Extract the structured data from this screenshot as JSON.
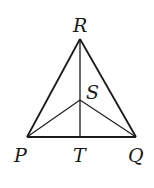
{
  "diagram": {
    "type": "triangle",
    "points": {
      "R": {
        "label": "R",
        "x": 80,
        "y": 39
      },
      "P": {
        "label": "P",
        "x": 27,
        "y": 137
      },
      "Q": {
        "label": "Q",
        "x": 136,
        "y": 137
      },
      "T": {
        "label": "T",
        "x": 80,
        "y": 137
      },
      "S": {
        "label": "S",
        "x": 80,
        "y": 100
      }
    },
    "segments": [
      "PR",
      "RQ",
      "PQ",
      "RT",
      "PS",
      "QS"
    ],
    "labels": {
      "R": "R",
      "S": "S",
      "P": "P",
      "T": "T",
      "Q": "Q"
    },
    "line_color": "#1a1a1a"
  }
}
